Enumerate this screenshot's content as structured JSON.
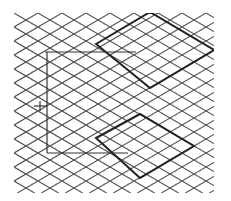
{
  "diagram": {
    "type": "isometric-grid",
    "background": "#ffffff",
    "grid": {
      "x0": 14,
      "y0": 13,
      "x1": 214,
      "y1": 193,
      "cell_width": 24,
      "cell_height": 14,
      "line_color": "#555555",
      "line_width": 1.1
    },
    "highlights": [
      {
        "name": "upper-diamond",
        "points": [
          [
            96,
            44
          ],
          [
            150,
            12
          ],
          [
            214,
            50
          ],
          [
            150,
            88
          ]
        ],
        "color": "#222222",
        "width": 2
      },
      {
        "name": "lower-diamond",
        "points": [
          [
            96,
            138
          ],
          [
            140,
            114
          ],
          [
            194,
            146
          ],
          [
            140,
            178
          ]
        ],
        "color": "#222222",
        "width": 2
      }
    ],
    "bracket": {
      "color": "#333333",
      "top_line": [
        [
          45,
          52
        ],
        [
          136,
          52
        ]
      ],
      "vertical_line": [
        [
          47,
          52
        ],
        [
          47,
          153
        ]
      ],
      "bottom_line": [
        [
          47,
          153
        ],
        [
          128,
          153
        ]
      ],
      "tick": [
        [
          34,
          106
        ],
        [
          47,
          106
        ]
      ],
      "tick_mark": [
        [
          40,
          101
        ],
        [
          40,
          111
        ]
      ]
    }
  }
}
